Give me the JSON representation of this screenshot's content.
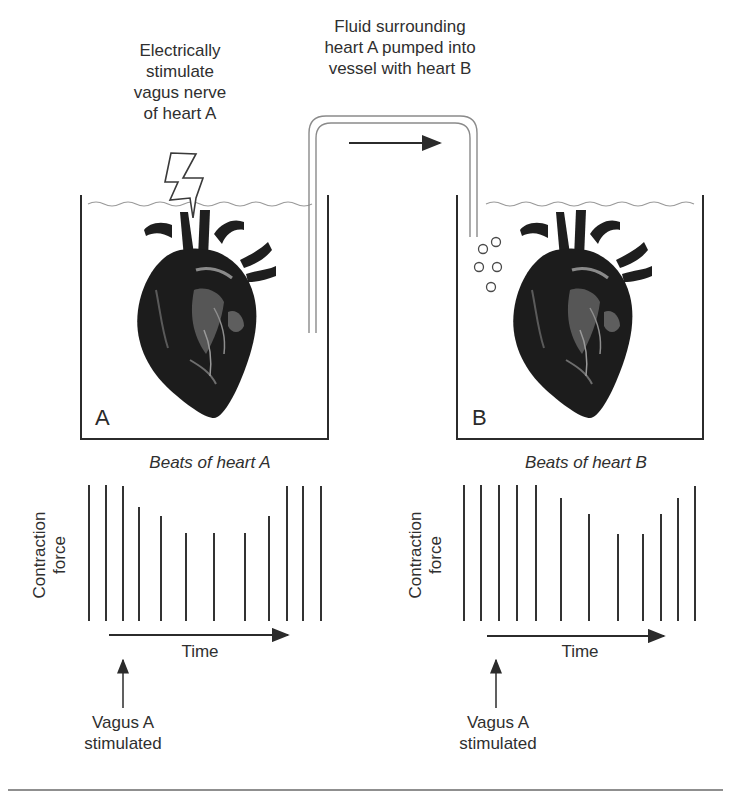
{
  "diagram": {
    "stimulus_label": [
      "Electrically",
      "stimulate",
      "vagus nerve",
      "of heart A"
    ],
    "transfer_label": [
      "Fluid surrounding",
      "heart A pumped into",
      "vessel with heart B"
    ],
    "vessel_a": {
      "letter": "A"
    },
    "vessel_b": {
      "letter": "B"
    },
    "icons": {
      "lightning": "lightning-bolt-icon",
      "heart": "anatomical-heart-illustration",
      "bubbles": "fluid-bubbles-icon",
      "flow_arrow": "right-arrow-icon"
    },
    "colors": {
      "line": "#2b2b2b",
      "tube": "#8a8a8a",
      "water": "#9a9a9a",
      "background": "#ffffff"
    },
    "rule": true
  },
  "charts": {
    "a": {
      "title": "Beats of heart A",
      "ylabel_line1": "Contraction",
      "ylabel_line2": "force",
      "xlabel": "Time",
      "annotation_line1": "Vagus A",
      "annotation_line2": "stimulated"
    },
    "b": {
      "title": "Beats of heart B",
      "ylabel_line1": "Contraction",
      "ylabel_line2": "force",
      "xlabel": "Time",
      "annotation_line1": "Vagus A",
      "annotation_line2": "stimulated"
    }
  },
  "chart_data": [
    {
      "type": "bar",
      "title": "Beats of heart A",
      "xlabel": "Time",
      "ylabel": "Contraction force",
      "annotation": "Vagus A stimulated (arrow at beat 3)",
      "categories": [
        1,
        2,
        3,
        4,
        5,
        6,
        7,
        8,
        9,
        10,
        11,
        12
      ],
      "x_px": [
        89,
        106,
        123,
        139,
        161,
        186,
        214,
        245,
        269,
        287,
        303,
        321
      ],
      "values": [
        136,
        136,
        135,
        114,
        105,
        88,
        88,
        88,
        105,
        135,
        135,
        135
      ],
      "grid": false
    },
    {
      "type": "bar",
      "title": "Beats of heart B",
      "xlabel": "Time",
      "ylabel": "Contraction force",
      "annotation": "Vagus A stimulated (arrow at beat 3)",
      "categories": [
        1,
        2,
        3,
        4,
        5,
        6,
        7,
        8,
        9,
        10,
        11,
        12
      ],
      "x_px": [
        464,
        481,
        499,
        517,
        536,
        561,
        589,
        618,
        643,
        661,
        678,
        695
      ],
      "values": [
        136,
        136,
        136,
        136,
        136,
        123,
        107,
        87,
        87,
        107,
        123,
        135
      ],
      "grid": false
    }
  ]
}
